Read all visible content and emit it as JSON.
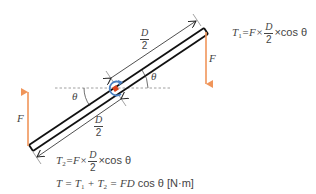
{
  "diagram": {
    "colors": {
      "arm": "#111111",
      "force": "#f0955a",
      "pivot": "#d9431e",
      "rotation": "#4a7fc1",
      "text": "#444444",
      "dashed": "#888888"
    },
    "upper_dimension": {
      "numerator": "D",
      "denominator": "2"
    },
    "lower_dimension": {
      "numerator": "D",
      "denominator": "2"
    },
    "angle_upper": "θ",
    "angle_lower": "θ",
    "force_right": "F",
    "force_left": "F",
    "formula_t1": {
      "lhs": "T",
      "lhs_sub": "1",
      "eq": "=F×",
      "frac_num": "D",
      "frac_den": "2",
      "tail": "×cos θ"
    },
    "formula_t2": {
      "lhs": "T",
      "lhs_sub": "2",
      "eq": "=F×",
      "frac_num": "D",
      "frac_den": "2",
      "tail": "×cos θ"
    },
    "formula_total": {
      "text_a": "T = T",
      "sub1": "1",
      "text_b": " + T",
      "sub2": "2",
      "text_c": " = FD",
      "text_d": " cos θ [N·m]"
    }
  }
}
